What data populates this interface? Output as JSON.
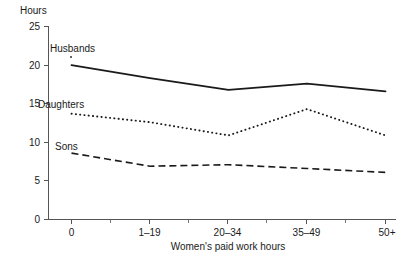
{
  "chart_data": {
    "type": "line",
    "title": "",
    "xlabel": "Women's paid work hours",
    "ylabel": "Hours",
    "categories": [
      "0",
      "1–19",
      "20–34",
      "35–49",
      "50+"
    ],
    "ylim": [
      0,
      25
    ],
    "yticks": [
      0,
      5,
      10,
      15,
      20,
      25
    ],
    "yticklabels": [
      "0",
      "5",
      "10",
      "15",
      "20",
      "25"
    ],
    "grid": false,
    "legend_position": "inline-labels",
    "series": [
      {
        "name": "Husbands",
        "style": "solid",
        "values": [
          20.0,
          18.3,
          16.8,
          17.6,
          16.6
        ],
        "label_x_category": "0",
        "annotation": "Husbands"
      },
      {
        "name": "Daughters",
        "style": "dotted",
        "values": [
          13.7,
          12.6,
          10.9,
          14.3,
          10.9
        ],
        "label_x_category": "0",
        "annotation": "Daughters"
      },
      {
        "name": "Sons",
        "style": "dashed",
        "values": [
          8.6,
          6.9,
          7.1,
          6.6,
          6.1
        ],
        "label_x_category": "0",
        "annotation": "Sons"
      }
    ]
  },
  "axes": {
    "y_axis_title": "Hours",
    "x_axis_title": "Women's paid work hours",
    "y_tick_labels": [
      "25",
      "20",
      "15",
      "10",
      "5",
      "0"
    ],
    "x_tick_labels": [
      "0",
      "1–19",
      "20–34",
      "35–49",
      "50+"
    ]
  },
  "series_labels": {
    "husbands": "Husbands",
    "daughters": "Daughters",
    "sons": "Sons"
  },
  "colors": {
    "line": "#1a1a1a",
    "axis": "#555555",
    "background": "#ffffff"
  }
}
